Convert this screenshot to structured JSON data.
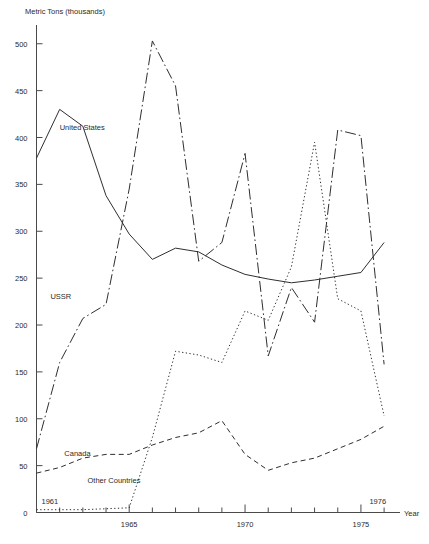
{
  "chart_data": {
    "type": "line",
    "title": "",
    "ylabel": "Metric Tons (thousands)",
    "xlabel": "Year",
    "ylim": [
      0,
      520
    ],
    "xlim": [
      1961,
      1976.6
    ],
    "grid": false,
    "legend": "inline-series-labels",
    "y_ticks": [
      0,
      50,
      100,
      150,
      200,
      250,
      300,
      350,
      400,
      450,
      500
    ],
    "y_tick_labels": [
      "0",
      "50",
      "100",
      "150",
      "200",
      "250",
      "300",
      "350",
      "400",
      "450",
      "500"
    ],
    "x_ticks": [
      1961,
      1962,
      1963,
      1964,
      1965,
      1966,
      1967,
      1968,
      1969,
      1970,
      1971,
      1972,
      1973,
      1974,
      1975,
      1976
    ],
    "x_tick_labels_shown": [
      "1965",
      "1970",
      "1975"
    ],
    "x_tick_label_values": [
      1965,
      1970,
      1975
    ],
    "x_endpoint_labels": [
      {
        "text": "1961",
        "value": 1961
      },
      {
        "text": "1976",
        "value": 1976
      }
    ],
    "x": [
      1961,
      1962,
      1963,
      1964,
      1965,
      1966,
      1967,
      1968,
      1969,
      1970,
      1971,
      1972,
      1973,
      1974,
      1975,
      1976
    ],
    "series": [
      {
        "name": "United States",
        "style": "solid",
        "label": "United States",
        "label_x": 1962.0,
        "label_y": 408,
        "values": [
          378,
          430,
          412,
          338,
          297,
          270,
          282,
          278,
          264,
          254,
          249,
          245,
          248,
          252,
          256,
          288
        ]
      },
      {
        "name": "USSR",
        "style": "dash-dot",
        "label": "USSR",
        "label_x": 1961.6,
        "label_y": 228,
        "values": [
          68,
          160,
          207,
          222,
          345,
          503,
          455,
          268,
          288,
          383,
          167,
          240,
          203,
          408,
          402,
          158
        ]
      },
      {
        "name": "Canada",
        "style": "dashed",
        "label": "Canada",
        "label_x": 1962.2,
        "label_y": 60,
        "values": [
          42,
          48,
          58,
          62,
          62,
          72,
          80,
          85,
          98,
          62,
          45,
          53,
          58,
          68,
          78,
          92
        ]
      },
      {
        "name": "Other Countries",
        "style": "dotted",
        "label": "Other Countries",
        "label_x": 1963.2,
        "label_y": 32,
        "values": [
          3,
          3,
          3,
          4,
          5,
          80,
          172,
          168,
          160,
          215,
          205,
          262,
          395,
          228,
          215,
          103
        ]
      }
    ]
  }
}
